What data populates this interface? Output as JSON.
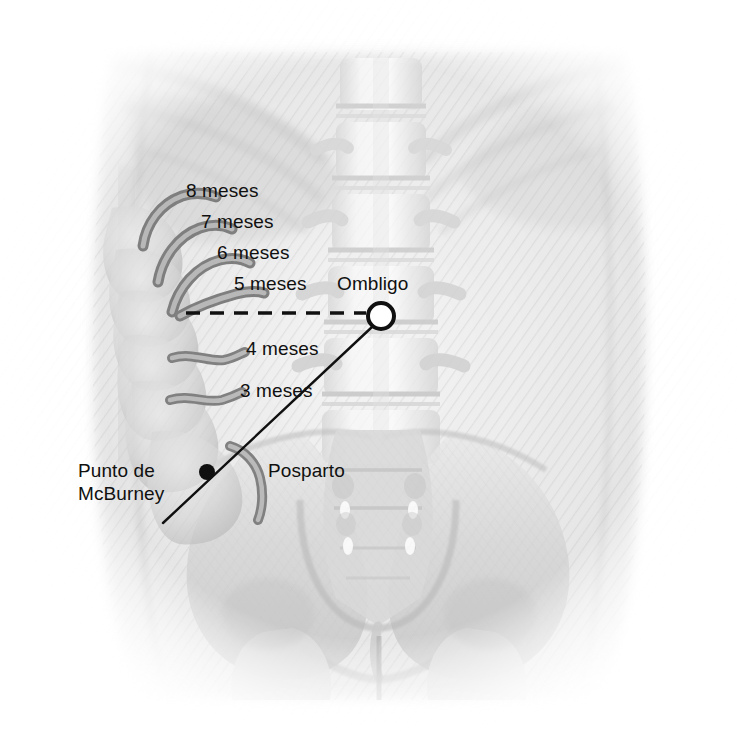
{
  "figure": {
    "language": "es",
    "background_color": "#ffffff",
    "ink_color": "#101010",
    "appendix_color": "#8a8a8a",
    "anatomy_tint": "#c9c9c9"
  },
  "labels": {
    "months_8": "8 meses",
    "months_7": "7 meses",
    "months_6": "6 meses",
    "months_5": "5 meses",
    "months_4": "4 meses",
    "months_3": "3 meses",
    "umbilicus": "Ombligo",
    "postpartum": "Posparto",
    "mcburney_line1": "Punto de",
    "mcburney_line2": "McBurney"
  },
  "markers": {
    "umbilicus_marker": {
      "shape": "open-circle",
      "cx": 381,
      "cy": 316,
      "r": 13,
      "stroke": "#101010",
      "stroke_width": 4,
      "fill": "none"
    },
    "mcburney_point": {
      "shape": "filled-circle",
      "cx": 207,
      "cy": 472,
      "r": 8,
      "fill": "#101010"
    }
  },
  "connectors": {
    "dashed_umbilical_line": {
      "style": "dashed",
      "x1": 186,
      "y1": 313,
      "x2": 366,
      "y2": 313,
      "stroke": "#101010",
      "stroke_width": 3.5,
      "dash": "14 10"
    },
    "mcburney_line": {
      "style": "solid",
      "x1": 371,
      "y1": 328,
      "x2": 163,
      "y2": 523,
      "stroke": "#101010",
      "stroke_width": 2.4
    },
    "umbilicus_leader": {
      "style": "solid",
      "x1": 372,
      "y1": 326,
      "x2": 381,
      "y2": 316
    }
  },
  "label_positions": {
    "months_8": {
      "left": 186,
      "top": 179
    },
    "months_7": {
      "left": 201,
      "top": 210
    },
    "months_6": {
      "left": 217,
      "top": 241
    },
    "months_5": {
      "left": 234,
      "top": 272
    },
    "months_4": {
      "left": 246,
      "top": 337
    },
    "months_3": {
      "left": 240,
      "top": 379
    },
    "umbilicus": {
      "left": 337,
      "top": 272
    },
    "postpartum": {
      "left": 268,
      "top": 459
    },
    "mcburney": {
      "left": 78,
      "top": 459
    }
  },
  "appendix_positions": [
    {
      "month": "8 meses",
      "tip_x": 214,
      "tip_y": 196,
      "base_x": 143,
      "base_y": 246
    },
    {
      "month": "7 meses",
      "tip_x": 228,
      "tip_y": 227,
      "base_x": 158,
      "base_y": 281
    },
    {
      "month": "6 meses",
      "tip_x": 245,
      "tip_y": 258,
      "base_x": 172,
      "base_y": 308
    },
    {
      "month": "5 meses",
      "tip_x": 260,
      "tip_y": 292,
      "base_x": 186,
      "base_y": 314
    },
    {
      "month": "4 meses",
      "tip_x": 240,
      "tip_y": 352,
      "base_x": 176,
      "base_y": 359
    },
    {
      "month": "3 meses",
      "tip_x": 236,
      "tip_y": 394,
      "base_x": 175,
      "base_y": 400
    },
    {
      "month": "Posparto",
      "tip_x": 264,
      "tip_y": 495,
      "base_x": 232,
      "base_y": 447
    }
  ],
  "anatomy_parts": [
    "torso-outline",
    "lumbar-spine",
    "ribs-left",
    "ribs-right",
    "liver-shadow",
    "pelvis-left-ilium",
    "pelvis-right-ilium",
    "sacrum",
    "sacral-foramina",
    "pubic-symphysis",
    "femoral-head-left",
    "femoral-head-right",
    "ascending-colon"
  ]
}
